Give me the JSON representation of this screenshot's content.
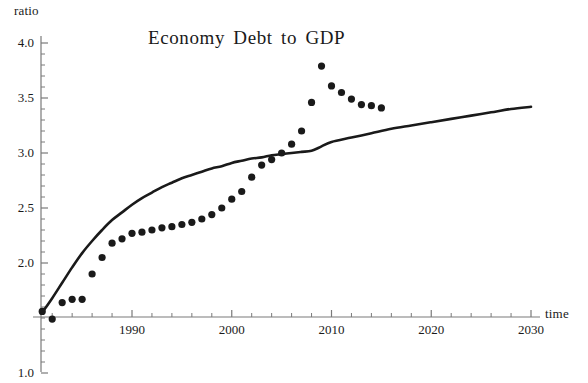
{
  "chart_data": {
    "type": "scatter",
    "title": "Economy Debt to GDP",
    "xlabel": "time",
    "ylabel": "ratio",
    "xlim": [
      1980.5,
      2030.5
    ],
    "ylim": [
      1.0,
      4.05
    ],
    "axis_origin_y": 1.5,
    "grid": false,
    "legend": false,
    "x_ticks_major": [
      1990,
      2000,
      2010,
      2020,
      2030
    ],
    "x_tick_labels": [
      "1990",
      "2000",
      "2010",
      "2020",
      "2030"
    ],
    "x_minor_tick_step": 2,
    "y_ticks_major": [
      4.0,
      3.5,
      3.0,
      2.5,
      2.0,
      1.0
    ],
    "y_tick_labels": [
      "4.0",
      "3.5",
      "3.0",
      "2.5",
      "2.0",
      "1.0"
    ],
    "y_minor_tick_step": 0.1,
    "series": [
      {
        "name": "observed data",
        "type": "scatter",
        "marker": "filled-circle",
        "color": "#1a1a1a",
        "x": [
          1981,
          1982,
          1983,
          1984,
          1985,
          1986,
          1987,
          1988,
          1989,
          1990,
          1991,
          1992,
          1993,
          1994,
          1995,
          1996,
          1997,
          1998,
          1999,
          2000,
          2001,
          2002,
          2003,
          2004,
          2005,
          2006,
          2007,
          2008,
          2009,
          2010,
          2011,
          2012,
          2013,
          2014,
          2015
        ],
        "y": [
          1.56,
          1.49,
          1.64,
          1.67,
          1.67,
          1.9,
          2.05,
          2.18,
          2.22,
          2.27,
          2.28,
          2.3,
          2.32,
          2.33,
          2.35,
          2.37,
          2.4,
          2.44,
          2.5,
          2.58,
          2.65,
          2.78,
          2.89,
          2.94,
          3.0,
          3.08,
          3.2,
          3.46,
          3.79,
          3.61,
          3.55,
          3.49,
          3.44,
          3.43,
          3.41
        ]
      },
      {
        "name": "fitted curve",
        "type": "line",
        "color": "#1a1a1a",
        "x": [
          1981,
          1982,
          1983,
          1984,
          1985,
          1986,
          1987,
          1988,
          1989,
          1990,
          1991,
          1992,
          1993,
          1994,
          1995,
          1996,
          1997,
          1998,
          1999,
          2000,
          2001,
          2002,
          2003,
          2004,
          2005,
          2006,
          2007,
          2008,
          2009,
          2010,
          2012,
          2014,
          2016,
          2018,
          2020,
          2022,
          2024,
          2026,
          2028,
          2030
        ],
        "y": [
          1.55,
          1.68,
          1.82,
          1.96,
          2.09,
          2.2,
          2.3,
          2.39,
          2.46,
          2.53,
          2.59,
          2.64,
          2.69,
          2.73,
          2.77,
          2.8,
          2.83,
          2.86,
          2.88,
          2.91,
          2.93,
          2.95,
          2.96,
          2.98,
          2.99,
          3.0,
          3.01,
          3.02,
          3.06,
          3.1,
          3.14,
          3.18,
          3.22,
          3.25,
          3.28,
          3.31,
          3.34,
          3.37,
          3.4,
          3.42
        ]
      }
    ]
  }
}
